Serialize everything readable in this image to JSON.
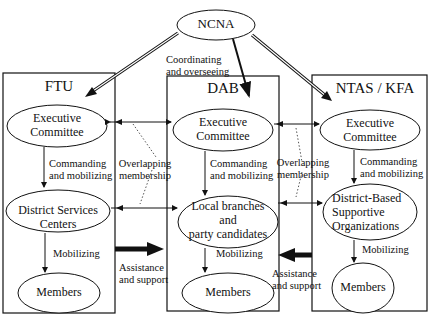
{
  "root": {
    "label": "NCNA",
    "edge_label": "Coordinating\nand overseeing"
  },
  "columns": [
    {
      "title": "FTU",
      "nodes": [
        "Executive\nCommittee",
        "District Services\nCenters",
        "Members"
      ],
      "edges": [
        "Commanding\nand mobilizing",
        "Mobilizing"
      ]
    },
    {
      "title": "DAB",
      "nodes": [
        "Executive\nCommittee",
        "Local branches\nand\nparty candidates",
        "Members"
      ],
      "edges": [
        "Commanding\nand mobilizing",
        "Mobilizing"
      ]
    },
    {
      "title": "NTAS / KFA",
      "nodes": [
        "Executive\nCommittee",
        "District-Based\nSupportive\nOrganizations",
        "Members"
      ],
      "edges": [
        "Commanding\nand mobilizing",
        "Mobilizing"
      ]
    }
  ],
  "cross_links": {
    "overlap_left": "Overlapping\nmembership",
    "overlap_right": "Overlapping\nmembership",
    "assist_left": "Assistance\nand support",
    "assist_right": "Assistance\nand support"
  }
}
